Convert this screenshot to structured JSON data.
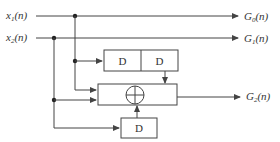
{
  "diagram": {
    "type": "block-diagram",
    "colors": {
      "line": "#444444",
      "text": "#333333",
      "background": "#ffffff"
    },
    "inputs": [
      {
        "id": "x1",
        "name": "x",
        "sub": "1",
        "arg": "(n)"
      },
      {
        "id": "x2",
        "name": "x",
        "sub": "2",
        "arg": "(n)"
      }
    ],
    "outputs": [
      {
        "id": "G0",
        "name": "G",
        "sub": "0",
        "arg": "(n)"
      },
      {
        "id": "G1",
        "name": "G",
        "sub": "1",
        "arg": "(n)"
      },
      {
        "id": "G2",
        "name": "G",
        "sub": "2",
        "arg": "(n)"
      }
    ],
    "blocks": {
      "delay_top_1": "D",
      "delay_top_2": "D",
      "delay_bottom": "D",
      "adder": "mod-2 adder (⊕)"
    },
    "connections": [
      "x1(n) → G0(n)",
      "x2(n) → G1(n)",
      "x1(n) → D → D → ⊕",
      "x1(n) → ⊕",
      "x2(n) → ⊕",
      "x2(n) → D → ⊕",
      "⊕ → G2(n)"
    ]
  }
}
